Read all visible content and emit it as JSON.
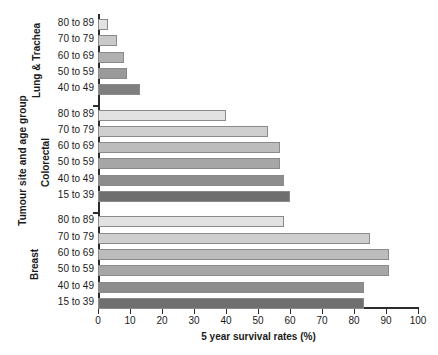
{
  "chart_data": {
    "type": "bar",
    "orientation": "horizontal",
    "title": "",
    "xlabel": "5 year survival rates (%)",
    "ylabel": "Tumour site and age group",
    "xlim": [
      0,
      100
    ],
    "xticks": [
      0,
      10,
      20,
      30,
      40,
      50,
      60,
      70,
      80,
      90,
      100
    ],
    "grid": false,
    "legend": "none",
    "groups": [
      {
        "name": "Lung & Trachea",
        "categories": [
          "80 to 89",
          "70 to 79",
          "60 to 69",
          "50 to 59",
          "40 to 49"
        ],
        "values": [
          3,
          6,
          8,
          9,
          13
        ],
        "colors": [
          "#e2e2e2",
          "#c9c9c9",
          "#b0b0b0",
          "#9a9a9a",
          "#7e7e7e"
        ]
      },
      {
        "name": "Colorectal",
        "categories": [
          "80 to 89",
          "70 to 79",
          "60 to 69",
          "50 to 59",
          "40 to 49",
          "15 to 39"
        ],
        "values": [
          40,
          53,
          57,
          57,
          58,
          60
        ],
        "colors": [
          "#e2e2e2",
          "#cfcfcf",
          "#bcbcbc",
          "#a6a6a6",
          "#8d8d8d",
          "#6f6f6f"
        ]
      },
      {
        "name": "Breast",
        "categories": [
          "80 to 89",
          "70 to 79",
          "60 to 69",
          "50 to 59",
          "40 to 49",
          "15 to 39"
        ],
        "values": [
          58,
          85,
          91,
          91,
          83,
          83
        ],
        "colors": [
          "#e2e2e2",
          "#cfcfcf",
          "#bcbcbc",
          "#a6a6a6",
          "#8d8d8d",
          "#6f6f6f"
        ]
      }
    ]
  },
  "axes": {
    "x_title": "5 year survival rates (%)",
    "y_title": "Tumour site and age group",
    "x_tick_labels": [
      "0",
      "10",
      "20",
      "30",
      "40",
      "50",
      "60",
      "70",
      "80",
      "90",
      "100"
    ]
  },
  "group_labels": {
    "lung": "Lung & Trachea",
    "colorectal": "Colorectal",
    "breast": "Breast"
  }
}
